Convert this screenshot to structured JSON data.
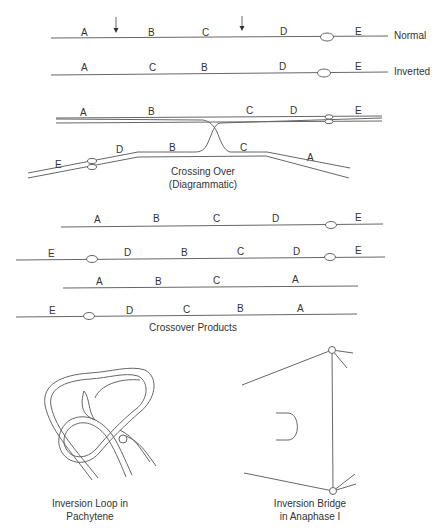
{
  "row_labels": {
    "normal": "Normal",
    "inverted": "Inverted"
  },
  "normal_genes": [
    "A",
    "B",
    "C",
    "D",
    "E"
  ],
  "inverted_genes": [
    "A",
    "C",
    "B",
    "D",
    "E"
  ],
  "crossing_over": {
    "top_genes": [
      "A",
      "B",
      "C",
      "D",
      "E"
    ],
    "bottom_genes": [
      "E",
      "D",
      "B",
      "C",
      "A"
    ],
    "caption_line1": "Crossing Over",
    "caption_line2": "(Diagrammatic)"
  },
  "crossover_products": {
    "rows": [
      [
        "A",
        "B",
        "C",
        "D",
        "E"
      ],
      [
        "E",
        "D",
        "B",
        "C",
        "D",
        "E"
      ],
      [
        "A",
        "B",
        "C",
        "A"
      ],
      [
        "E",
        "D",
        "C",
        "B",
        "A"
      ]
    ],
    "caption": "Crossover Products"
  },
  "loop": {
    "caption_line1": "Inversion Loop in",
    "caption_line2": "Pachytene"
  },
  "bridge": {
    "caption_line1": "Inversion Bridge",
    "caption_line2": "in Anaphase I"
  }
}
